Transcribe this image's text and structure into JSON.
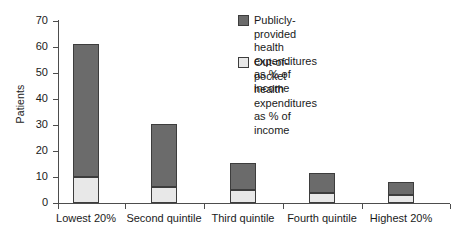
{
  "chart_data": {
    "type": "bar",
    "title": "",
    "xlabel": "",
    "ylabel": "Patients",
    "ylim": [
      0,
      70
    ],
    "yticks": [
      0,
      10,
      20,
      30,
      40,
      50,
      60,
      70
    ],
    "grid": false,
    "stacked": true,
    "legend_position": "top-right",
    "categories": [
      "Lowest 20%",
      "Second quintile",
      "Third quintile",
      "Fourth quintile",
      "Highest 20%"
    ],
    "series": [
      {
        "name": "Out-of-pocket health expenditures as % of income",
        "color": "#e8e8e8",
        "values": [
          10,
          6,
          5,
          4,
          3
        ]
      },
      {
        "name": "Publicly-provided health expenditures as % of income",
        "color": "#6b6b6b",
        "values": [
          51,
          24.5,
          10.5,
          7.5,
          5
        ]
      }
    ],
    "totals": [
      61,
      30.5,
      15.5,
      11.5,
      8
    ]
  },
  "axes": {
    "y_title": "Patients",
    "y_tick_labels": [
      "70",
      "60",
      "50",
      "40",
      "30",
      "20",
      "10",
      "0"
    ],
    "x_tick_labels": [
      "Lowest 20%",
      "Second\nquintile",
      "Third\nquintile",
      "Fourth\nquintile",
      "Highest 20%"
    ]
  },
  "legend": {
    "items": [
      {
        "swatch_name": "legend-swatch-public",
        "color": "#6b6b6b",
        "label": "Publicly-provided\nhealth expenditures\nas % of income"
      },
      {
        "swatch_name": "legend-swatch-out-of-pocket",
        "color": "#e8e8e8",
        "label": "Out-of-pocket health\nexpenditures as % of\nincome"
      }
    ]
  },
  "colors": {
    "public_fill": "#6b6b6b",
    "out_of_pocket_fill": "#e8e8e8",
    "outline": "#3d3d3d",
    "axis": "#4d4d4d",
    "text": "#1a1a1a",
    "background": "#ffffff"
  }
}
